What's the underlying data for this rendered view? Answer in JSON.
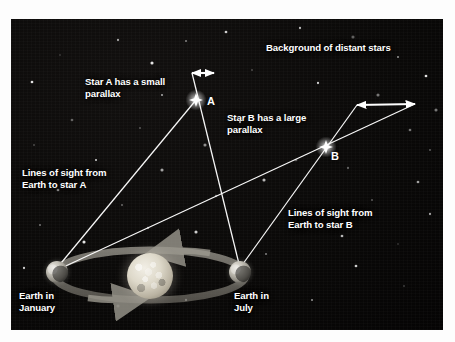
{
  "figure": {
    "background_color": "#0a0908",
    "line_color": "#ffffff",
    "label_color": "#ffffff",
    "orbit_color": "#8f8c84"
  },
  "labels": {
    "background_stars": "Background of distant stars",
    "star_a_note": "Star A has a small\nparallax",
    "star_b_note": "Star B has a large\nparallax",
    "lines_a": "Lines of sight from\nEarth to star A",
    "lines_b": "Lines of sight from\nEarth to star B",
    "earth_january": "Earth in\nJanuary",
    "earth_july": "Earth in\nJuly"
  },
  "markers": {
    "star_a_letter": "A",
    "star_b_letter": "B"
  },
  "objects": {
    "sun": {
      "name": "sun",
      "cx": 150,
      "cy": 276,
      "r": 23
    },
    "earth_january": {
      "name": "earth-january",
      "cx": 57,
      "cy": 272,
      "r": 11
    },
    "earth_july": {
      "name": "earth-july",
      "cx": 240,
      "cy": 272,
      "r": 11
    },
    "star_a": {
      "name": "star-a",
      "cx": 196,
      "cy": 100
    },
    "star_b": {
      "name": "star-b",
      "cx": 326,
      "cy": 147
    }
  },
  "parallax_arrows": {
    "star_a": {
      "x1": 192,
      "y1": 73,
      "x2": 214,
      "y2": 73,
      "description": "small parallax shift"
    },
    "star_b": {
      "x1": 357,
      "y1": 105,
      "x2": 415,
      "y2": 104,
      "description": "large parallax shift"
    }
  },
  "sight_lines": [
    {
      "from": "earth_january",
      "to": "star_a",
      "x1": 57,
      "y1": 268,
      "x2": 196,
      "y2": 100
    },
    {
      "from": "earth_july",
      "to": "star_a",
      "x1": 240,
      "y1": 268,
      "x2": 192,
      "y2": 73
    },
    {
      "from": "earth_january",
      "to": "star_b",
      "x1": 57,
      "y1": 270,
      "x2": 415,
      "y2": 104
    },
    {
      "from": "earth_july",
      "to": "star_b",
      "x1": 240,
      "y1": 268,
      "x2": 357,
      "y2": 105
    }
  ],
  "orbit": {
    "cx": 150,
    "cy": 275,
    "rx": 96,
    "ry": 25,
    "direction_arrow_top": "left",
    "direction_arrow_bottom": "right"
  },
  "background_stars": [
    [
      60,
      55
    ],
    [
      118,
      40
    ],
    [
      152,
      63
    ],
    [
      186,
      41
    ],
    [
      226,
      32
    ],
    [
      268,
      48
    ],
    [
      300,
      28
    ],
    [
      353,
      37
    ],
    [
      398,
      57
    ],
    [
      426,
      76
    ],
    [
      252,
      70
    ],
    [
      318,
      83
    ],
    [
      378,
      95
    ],
    [
      110,
      95
    ],
    [
      72,
      120
    ],
    [
      140,
      128
    ],
    [
      240,
      122
    ],
    [
      205,
      145
    ],
    [
      288,
      118
    ],
    [
      410,
      130
    ],
    [
      430,
      150
    ],
    [
      348,
      168
    ],
    [
      162,
      170
    ],
    [
      96,
      160
    ],
    [
      58,
      190
    ],
    [
      122,
      205
    ],
    [
      216,
      196
    ],
    [
      264,
      180
    ],
    [
      372,
      200
    ],
    [
      418,
      182
    ],
    [
      40,
      225
    ],
    [
      148,
      228
    ],
    [
      196,
      232
    ],
    [
      300,
      215
    ],
    [
      342,
      236
    ],
    [
      398,
      244
    ],
    [
      430,
      214
    ],
    [
      84,
      242
    ],
    [
      266,
      254
    ],
    [
      356,
      266
    ],
    [
      404,
      286
    ],
    [
      186,
      300
    ],
    [
      118,
      306
    ],
    [
      312,
      300
    ],
    [
      32,
      82
    ],
    [
      34,
      145
    ],
    [
      24,
      268
    ],
    [
      436,
      110
    ],
    [
      162,
      95
    ],
    [
      296,
      160
    ]
  ]
}
